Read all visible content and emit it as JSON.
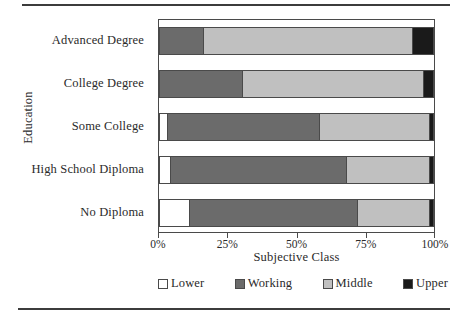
{
  "chart_data": {
    "type": "bar",
    "orientation": "horizontal",
    "stacked": true,
    "normalized": true,
    "title": "",
    "xlabel": "Subjective Class",
    "ylabel": "Education",
    "xlim": [
      0,
      100
    ],
    "grid": false,
    "legend_position": "bottom",
    "categories": [
      "Advanced Degree",
      "College Degree",
      "Some College",
      "High School Diploma",
      "No Diploma"
    ],
    "xticks": [
      0,
      25,
      50,
      75,
      100
    ],
    "xticklabels": [
      "0%",
      "25%",
      "50%",
      "75%",
      "100%"
    ],
    "series": [
      {
        "name": "Lower",
        "color": "#ffffff",
        "values": [
          0,
          0,
          3,
          4,
          11
        ]
      },
      {
        "name": "Working",
        "color": "#6b6b6b",
        "values": [
          16,
          30,
          55,
          64,
          61
        ]
      },
      {
        "name": "Middle",
        "color": "#c0c0c0",
        "values": [
          76,
          66,
          40,
          30,
          26
        ]
      },
      {
        "name": "Upper",
        "color": "#1a1a1a",
        "values": [
          8,
          4,
          2,
          2,
          2
        ]
      }
    ]
  },
  "axes": {
    "y_title": "Education",
    "x_title": "Subjective Class"
  }
}
